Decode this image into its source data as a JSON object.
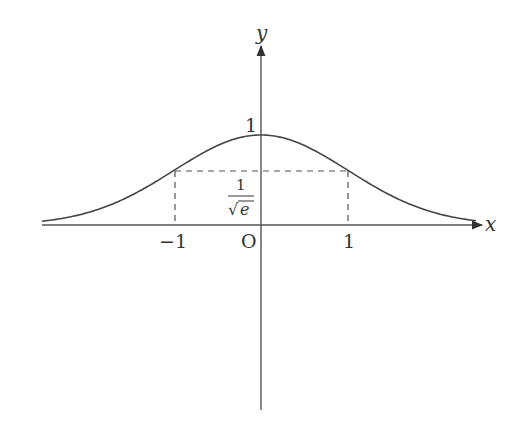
{
  "figure": {
    "axes": {
      "x_label": "x",
      "y_label": "y",
      "origin_label": "O"
    },
    "tick_labels": {
      "x_neg_one": "−1",
      "x_one": "1",
      "y_one": "1"
    },
    "annotation": {
      "fraction_numerator": "1",
      "fraction_denominator_radical": "√",
      "fraction_denominator_radicand": "e"
    },
    "function": "y = e^(-x^2/2)",
    "colors": {
      "curve": "#444444",
      "axis": "#555555",
      "dashed": "#555555",
      "text": "#333333"
    }
  }
}
